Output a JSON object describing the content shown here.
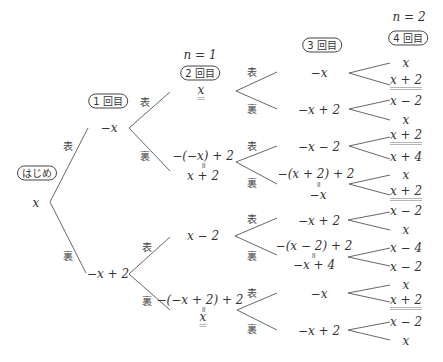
{
  "labels": {
    "start": "はじめ",
    "round1": "1 回目",
    "round2": "2 回目",
    "round3": "3 回目",
    "round4": "4 回目",
    "n1": "n = 1",
    "n2": "n = 2",
    "heads": "表",
    "tails": "裏",
    "equals_vertical": "॥"
  },
  "root": {
    "value": "x"
  },
  "col1": [
    {
      "value": "−x"
    },
    {
      "value": "−x + 2"
    }
  ],
  "col2": [
    {
      "expr": "",
      "value": "x",
      "highlight": true
    },
    {
      "expr": "−(−x) + 2",
      "value": "x + 2",
      "highlight": false
    },
    {
      "expr": "",
      "value": "x − 2",
      "highlight": false
    },
    {
      "expr": "−(−x + 2) + 2",
      "value": "x",
      "highlight": true
    }
  ],
  "col3": [
    {
      "expr": "",
      "value": "−x"
    },
    {
      "expr": "",
      "value": "−x + 2"
    },
    {
      "expr": "",
      "value": "−x − 2"
    },
    {
      "expr": "−(x + 2) + 2",
      "value": "−x"
    },
    {
      "expr": "",
      "value": "−x + 2"
    },
    {
      "expr": "−(x − 2) + 2",
      "value": "−x + 4"
    },
    {
      "expr": "",
      "value": "−x"
    },
    {
      "expr": "",
      "value": "−x + 2"
    }
  ],
  "col4": [
    {
      "value": "x",
      "highlight": false
    },
    {
      "value": "x + 2",
      "highlight": true
    },
    {
      "value": "x − 2",
      "highlight": false
    },
    {
      "value": "x",
      "highlight": false
    },
    {
      "value": "x + 2",
      "highlight": true
    },
    {
      "value": "x + 4",
      "highlight": false
    },
    {
      "value": "x",
      "highlight": false
    },
    {
      "value": "x + 2",
      "highlight": true
    },
    {
      "value": "x − 2",
      "highlight": false
    },
    {
      "value": "x",
      "highlight": false
    },
    {
      "value": "x − 4",
      "highlight": false
    },
    {
      "value": "x − 2",
      "highlight": false
    },
    {
      "value": "x",
      "highlight": false
    },
    {
      "value": "x + 2",
      "highlight": true
    },
    {
      "value": "x − 2",
      "highlight": false
    },
    {
      "value": "x",
      "highlight": false
    }
  ],
  "colors": {
    "line": "#555555",
    "text": "#333333",
    "highlight_underline": "#b5b5b5"
  }
}
